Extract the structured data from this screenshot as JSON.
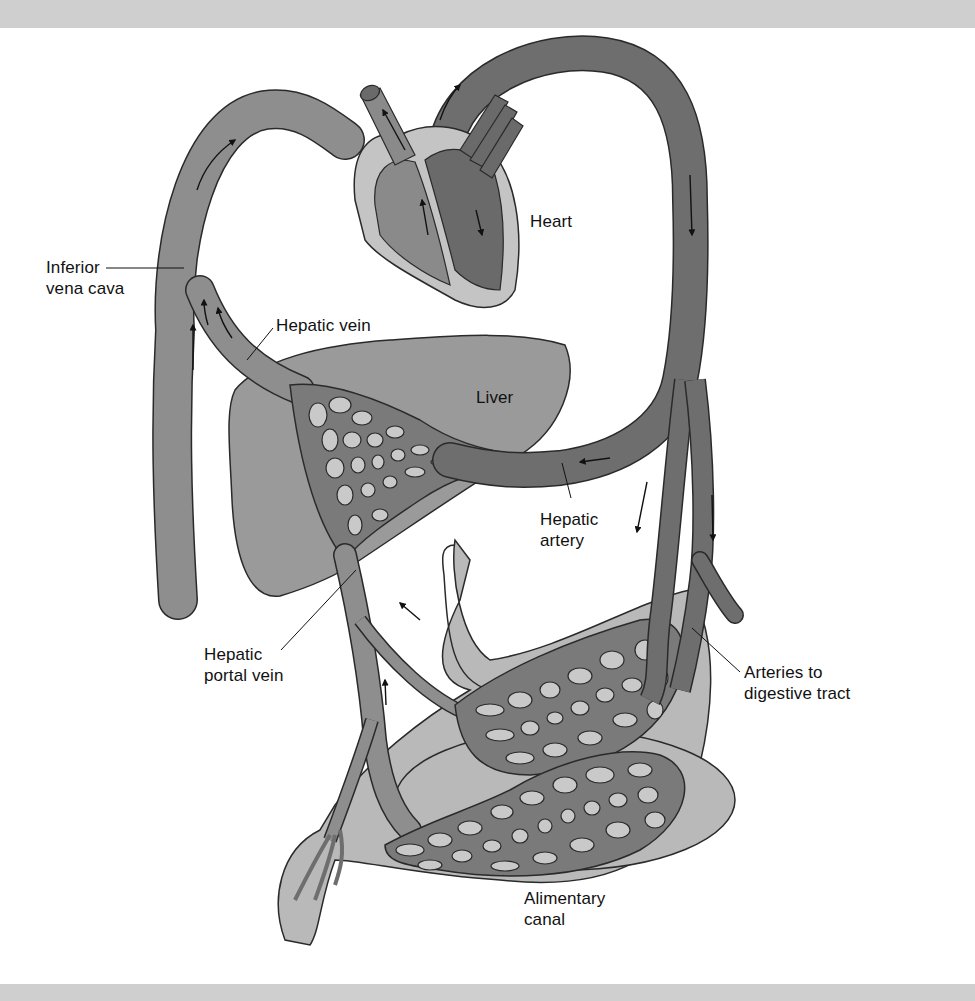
{
  "figure": {
    "frame": {
      "band_color": "#cfcfcf",
      "background": "#ffffff"
    },
    "colors": {
      "vein": "#8e8e8e",
      "artery": "#6e6e6e",
      "liver": "#9a9a9a",
      "heart_outer": "#c4c4c4",
      "heart_chamber_right": "#8a8a8a",
      "heart_chamber_left": "#6a6a6a",
      "gut": "#b9b9b9",
      "capillary_hole": "#c9c9c9",
      "outline": "#2a2a2a",
      "label_text": "#111111"
    },
    "labels": [
      {
        "id": "inferior-vena-cava",
        "text": "Inferior\nvena cava",
        "x": 46,
        "y": 257,
        "leader": [
          [
            106,
            268
          ],
          [
            184,
            268
          ]
        ]
      },
      {
        "id": "heart",
        "text": "Heart",
        "x": 530,
        "y": 211
      },
      {
        "id": "hepatic-vein",
        "text": "Hepatic vein",
        "x": 276,
        "y": 315,
        "leader": [
          [
            273,
            328
          ],
          [
            247,
            360
          ]
        ]
      },
      {
        "id": "liver",
        "text": "Liver",
        "x": 476,
        "y": 387
      },
      {
        "id": "hepatic-artery",
        "text": "Hepatic\nartery",
        "x": 540,
        "y": 509,
        "leader": [
          [
            571,
            498
          ],
          [
            562,
            463
          ]
        ]
      },
      {
        "id": "hepatic-portal-vein",
        "text": "Hepatic\nportal vein",
        "x": 204,
        "y": 644,
        "leader": [
          [
            281,
            650
          ],
          [
            356,
            570
          ]
        ]
      },
      {
        "id": "arteries-to-digestive-tract",
        "text": "Arteries to\ndigestive tract",
        "x": 744,
        "y": 662,
        "leader": [
          [
            740,
            672
          ],
          [
            692,
            628
          ]
        ]
      },
      {
        "id": "alimentary-canal",
        "text": "Alimentary\ncanal",
        "x": 524,
        "y": 888
      }
    ],
    "flow_arrows": [
      {
        "location": "vena cava arc",
        "direction": "up-right"
      },
      {
        "location": "inferior vena cava left",
        "direction": "up"
      },
      {
        "location": "hepatic vein",
        "direction": "up"
      },
      {
        "location": "pulmonary artery",
        "direction": "up"
      },
      {
        "location": "aorta arch",
        "direction": "up"
      },
      {
        "location": "right ventricle",
        "direction": "up"
      },
      {
        "location": "left ventricle",
        "direction": "down-right"
      },
      {
        "location": "descending aorta",
        "direction": "down"
      },
      {
        "location": "hepatic artery branch",
        "direction": "down"
      },
      {
        "location": "arteries to digestive tract",
        "direction": "down"
      },
      {
        "location": "hepatic artery",
        "direction": "left"
      },
      {
        "location": "hepatic portal vein upper",
        "direction": "up-left"
      },
      {
        "location": "hepatic portal vein lower",
        "direction": "up"
      }
    ],
    "structures": [
      "heart",
      "inferior vena cava",
      "hepatic vein",
      "liver",
      "liver capillary bed",
      "aorta",
      "hepatic artery",
      "arteries to digestive tract",
      "hepatic portal vein",
      "stomach capillary bed",
      "intestine capillary bed",
      "alimentary canal"
    ]
  }
}
